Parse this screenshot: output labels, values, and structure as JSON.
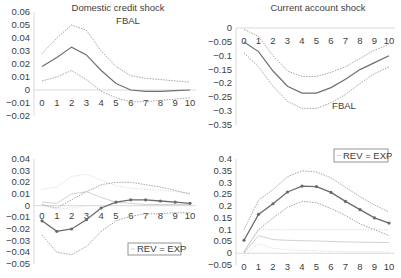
{
  "chart_data": [
    {
      "type": "line",
      "panel": "top-left",
      "title": "Domestic credit shock",
      "annotation": "FBAL",
      "x": [
        0,
        1,
        2,
        3,
        4,
        5,
        6,
        7,
        8,
        9,
        10
      ],
      "ylim": [
        -0.02,
        0.06
      ],
      "yticks": [
        "0.06",
        "0.05",
        "0.04",
        "0.03",
        "0.02",
        "0.01",
        "0",
        "−0.01",
        "−0.02"
      ],
      "yvals": [
        0.06,
        0.05,
        0.04,
        0.03,
        0.02,
        0.01,
        0,
        -0.01,
        -0.02
      ],
      "series": [
        {
          "name": "FBAL",
          "style": "solid",
          "values": [
            0.018,
            0.025,
            0.033,
            0.027,
            0.015,
            0.005,
            0.0,
            -0.001,
            -0.001,
            -0.0005,
            0.0
          ]
        },
        {
          "name": "upper band",
          "style": "dotted",
          "values": [
            0.028,
            0.04,
            0.05,
            0.046,
            0.03,
            0.018,
            0.011,
            0.009,
            0.008,
            0.007,
            0.006
          ]
        },
        {
          "name": "lower band",
          "style": "dotted",
          "values": [
            0.007,
            0.01,
            0.015,
            0.008,
            -0.001,
            -0.006,
            -0.009,
            -0.009,
            -0.008,
            -0.007,
            -0.006
          ]
        }
      ]
    },
    {
      "type": "line",
      "panel": "top-right",
      "title": "Current account shock",
      "annotation": "FBAL",
      "x": [
        0,
        1,
        2,
        3,
        4,
        5,
        6,
        7,
        8,
        9,
        10
      ],
      "ylim": [
        -0.35,
        0
      ],
      "yticks": [
        "0",
        "−0.05",
        "−0.1",
        "−0.15",
        "−0.2",
        "−0.25",
        "−0.3",
        "−0.35"
      ],
      "yvals": [
        0,
        -0.05,
        -0.1,
        -0.15,
        -0.2,
        -0.25,
        -0.3,
        -0.35
      ],
      "series": [
        {
          "name": "FBAL",
          "style": "solid",
          "values": [
            -0.05,
            -0.085,
            -0.155,
            -0.21,
            -0.235,
            -0.235,
            -0.215,
            -0.185,
            -0.15,
            -0.125,
            -0.1
          ]
        },
        {
          "name": "upper band",
          "style": "dotted",
          "values": [
            -0.005,
            -0.03,
            -0.1,
            -0.155,
            -0.175,
            -0.175,
            -0.16,
            -0.14,
            -0.11,
            -0.08,
            -0.06
          ]
        },
        {
          "name": "lower band",
          "style": "dotted",
          "values": [
            -0.09,
            -0.14,
            -0.21,
            -0.265,
            -0.29,
            -0.29,
            -0.27,
            -0.24,
            -0.2,
            -0.165,
            -0.14
          ]
        }
      ]
    },
    {
      "type": "line",
      "panel": "bottom-left",
      "title": "",
      "legend": [
        "REV = EXP"
      ],
      "x": [
        0,
        1,
        2,
        3,
        4,
        5,
        6,
        7,
        8,
        9,
        10
      ],
      "ylim": [
        -0.05,
        0.04
      ],
      "yticks": [
        "0.04",
        "0.03",
        "0.02",
        "0.01",
        "0",
        "−0.01",
        "−0.02",
        "−0.03",
        "−0.04",
        "−0.05"
      ],
      "yvals": [
        0.04,
        0.03,
        0.02,
        0.01,
        0,
        -0.01,
        -0.02,
        -0.03,
        -0.04,
        -0.05
      ],
      "series": [
        {
          "name": "FBAL",
          "style": "solid-marker",
          "values": [
            -0.013,
            -0.022,
            -0.02,
            -0.012,
            -0.002,
            0.003,
            0.005,
            0.005,
            0.004,
            0.003,
            0.002
          ]
        },
        {
          "name": "upper band",
          "style": "dotted",
          "values": [
            0.001,
            -0.002,
            0.005,
            0.012,
            0.018,
            0.02,
            0.02,
            0.018,
            0.016,
            0.013,
            0.01
          ]
        },
        {
          "name": "lower band",
          "style": "dotted",
          "values": [
            -0.025,
            -0.04,
            -0.042,
            -0.035,
            -0.022,
            -0.013,
            -0.009,
            -0.007,
            -0.007,
            -0.006,
            -0.006
          ]
        },
        {
          "name": "REV = EXP",
          "style": "light-solid",
          "values": [
            0.003,
            0.002,
            0.01,
            0.012,
            0.007,
            0.003,
            0.002,
            0.001,
            0.001,
            0.001,
            0.001
          ]
        },
        {
          "name": "REV = EXP upper",
          "style": "light-dotted",
          "values": [
            0.014,
            0.016,
            0.025,
            0.027,
            0.022,
            0.017,
            0.015,
            0.014,
            0.013,
            0.012,
            0.011
          ]
        },
        {
          "name": "REV = EXP lower",
          "style": "light-dotted",
          "values": [
            0.0,
            -0.003,
            -0.002,
            0.0,
            0.0,
            0.0,
            0.0,
            0.0,
            0.0,
            0.0,
            0.0
          ]
        }
      ]
    },
    {
      "type": "line",
      "panel": "bottom-right",
      "title": "",
      "legend": [
        "REV = EXP"
      ],
      "x": [
        0,
        1,
        2,
        3,
        4,
        5,
        6,
        7,
        8,
        9,
        10
      ],
      "ylim": [
        -0.05,
        0.4
      ],
      "yticks": [
        "0.4",
        "0.35",
        "0.3",
        "0.25",
        "0.2",
        "0.15",
        "0.1",
        "0.05",
        "0",
        "−0.05"
      ],
      "yvals": [
        0.4,
        0.35,
        0.3,
        0.25,
        0.2,
        0.15,
        0.1,
        0.05,
        0,
        -0.05
      ],
      "series": [
        {
          "name": "FBAL",
          "style": "solid-marker",
          "values": [
            0.055,
            0.165,
            0.21,
            0.26,
            0.285,
            0.283,
            0.258,
            0.22,
            0.185,
            0.15,
            0.128
          ]
        },
        {
          "name": "upper band",
          "style": "dotted",
          "values": [
            0.1,
            0.225,
            0.27,
            0.325,
            0.35,
            0.345,
            0.32,
            0.28,
            0.24,
            0.205,
            0.175
          ]
        },
        {
          "name": "lower band",
          "style": "dotted",
          "values": [
            0.005,
            0.1,
            0.15,
            0.195,
            0.22,
            0.215,
            0.19,
            0.16,
            0.125,
            0.1,
            0.075
          ]
        },
        {
          "name": "REV = EXP",
          "style": "light-solid",
          "values": [
            0.0,
            0.075,
            0.058,
            0.055,
            0.053,
            0.052,
            0.05,
            0.048,
            0.047,
            0.046,
            0.045
          ]
        },
        {
          "name": "REV = EXP upper",
          "style": "light-dotted",
          "values": [
            0.01,
            0.1,
            0.1,
            0.1,
            0.1,
            0.1,
            0.1,
            0.1,
            0.1,
            0.1,
            0.1
          ]
        },
        {
          "name": "REV = EXP lower",
          "style": "light-dotted",
          "values": [
            -0.01,
            0.04,
            0.02,
            0.015,
            0.012,
            0.01,
            0.008,
            0.006,
            0.005,
            0.005,
            0.005
          ]
        }
      ]
    }
  ]
}
